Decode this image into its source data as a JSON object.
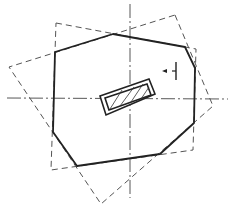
{
  "diagram": {
    "type": "technical-drawing",
    "background": "#ffffff",
    "colors": {
      "solid": "#222222",
      "dashed": "#555555",
      "centerline": "#444444",
      "hatch": "#333333"
    },
    "centerlines": {
      "vertical": {
        "x1": 130,
        "y1": 4,
        "x2": 130,
        "y2": 198
      },
      "horizontal": {
        "x1": 7,
        "y1": 98,
        "x2": 228,
        "y2": 99
      }
    },
    "outline_solid": {
      "points": "55,52 113,34 185,47 195,68 194,123 160,154 77,166 53,132"
    },
    "dashed_square_1": {
      "points": "56,23 196,49 193,150 51,170"
    },
    "dashed_square_2": {
      "points": "175,15 213,106 101,204 9,67"
    },
    "center_part": {
      "outer": "100,96 149,79 155,94 106,115",
      "inner": "105,98 147,84 151,95 109,110",
      "hatch_lines": [
        "110,109 122,90",
        "120,106 134,87",
        "131,102 143,84",
        "141,99 149,87"
      ]
    },
    "section_marker": {
      "arrow_from": [
        172,
        71
      ],
      "arrow_to": [
        162,
        71
      ],
      "bar_x": 176,
      "bar_y1": 62,
      "bar_y2": 80
    }
  }
}
